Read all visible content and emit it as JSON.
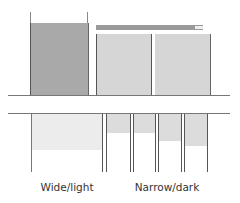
{
  "diagram": {
    "colors": {
      "dark_fill": "#a9a9a9",
      "light_fill": "#d6d6d6",
      "bar_fill": "#9a9a9a",
      "bar_end": "#e8e8e8",
      "bottom_light_fill": "#ececec",
      "bottom_dark_fill": "#dcdcdc",
      "line": "#555555"
    },
    "top": {
      "wide_box": {
        "x": 30,
        "y": 23,
        "w": 57,
        "h": 72
      },
      "wide_posts": [
        {
          "x": 30,
          "y": 12,
          "h": 11
        },
        {
          "x": 87,
          "y": 12,
          "h": 11
        }
      ],
      "bar": {
        "x": 96,
        "y": 25,
        "w": 107,
        "h": 5,
        "end_w": 8
      },
      "narrow_boxes": [
        {
          "x": 96,
          "y": 34,
          "w": 54,
          "h": 61
        },
        {
          "x": 155,
          "y": 34,
          "w": 55,
          "h": 61
        }
      ],
      "baseline_y": 95
    },
    "bottom": {
      "topline_y": 113,
      "wide": {
        "fill": {
          "x": 31,
          "y": 113,
          "w": 72,
          "h": 37
        },
        "posts": [
          31,
          102
        ]
      },
      "narrow": {
        "fills": [
          {
            "x": 107,
            "w": 23,
            "h": 20
          },
          {
            "x": 133,
            "w": 22,
            "h": 20
          },
          {
            "x": 158,
            "w": 23,
            "h": 28
          },
          {
            "x": 184,
            "w": 23,
            "h": 33
          }
        ],
        "posts": [
          104,
          107,
          130,
          133,
          155,
          158,
          181,
          184,
          207
        ]
      },
      "post_bottom_y": 172
    },
    "labels": {
      "wide": "Wide/light",
      "narrow": "Narrow/dark"
    }
  }
}
